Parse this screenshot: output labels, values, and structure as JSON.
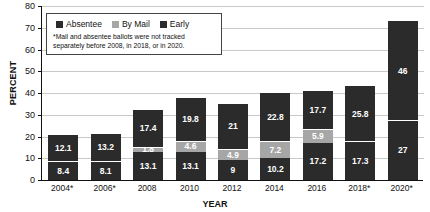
{
  "chart_data": {
    "type": "bar",
    "title": "",
    "subtitle": "",
    "xlabel": "YEAR",
    "ylabel": "PERCENT",
    "ylim": [
      0,
      80
    ],
    "yticks": [
      0,
      10,
      20,
      30,
      40,
      50,
      60,
      70,
      80
    ],
    "grid": true,
    "stacked": true,
    "legend_position": "top-left-inside",
    "categories": [
      "2004*",
      "2006*",
      "2008",
      "2010",
      "2012",
      "2014",
      "2016",
      "2018*",
      "2020*"
    ],
    "series": [
      {
        "name": "Absentee",
        "color": "#2b2b2b",
        "values": [
          8.4,
          8.1,
          13.1,
          13.1,
          9,
          10.2,
          17.2,
          17.3,
          27
        ],
        "labels": [
          "8.4",
          "8.1",
          "13.1",
          "13.1",
          "9",
          "10.2",
          "17.2",
          "17.3",
          "27"
        ]
      },
      {
        "name": "By Mail",
        "color": "#a6a6a6",
        "values": [
          null,
          null,
          1.8,
          4.6,
          4.9,
          7.2,
          5.9,
          null,
          null
        ],
        "labels": [
          "",
          "",
          "1.8",
          "4.6",
          "4.9",
          "7.2",
          "5.9",
          "",
          ""
        ]
      },
      {
        "name": "Early",
        "color": "#2b2b2b",
        "values": [
          12.1,
          13.2,
          17.4,
          19.8,
          21,
          22.8,
          17.7,
          25.8,
          46
        ],
        "labels": [
          "12.1",
          "13.2",
          "17.4",
          "19.8",
          "21",
          "22.8",
          "17.7",
          "25.8",
          "46"
        ]
      }
    ],
    "totals": [
      20.5,
      21.3,
      32.3,
      37.5,
      34.9,
      40.2,
      40.8,
      43.1,
      73
    ],
    "annotations": [
      "*Mail and absentee ballots were not tracked separately before 2008, in 2018, or in 2020."
    ]
  },
  "legend": {
    "items": [
      {
        "label": "Absentee",
        "swatch": "dark"
      },
      {
        "label": "By Mail",
        "swatch": "gray"
      },
      {
        "label": "Early",
        "swatch": "dark"
      }
    ],
    "note": "*Mail and absentee ballots were not tracked separately before 2008, in 2018, or in 2020."
  },
  "axes": {
    "y_title": "PERCENT",
    "x_title": "YEAR"
  }
}
